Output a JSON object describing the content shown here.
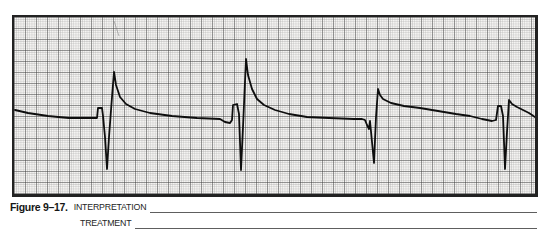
{
  "corner_mark": "’",
  "figure": {
    "label": "Figure 9–17.",
    "fields": [
      {
        "name": "INTERPRETATION"
      },
      {
        "name": "TREATMENT"
      }
    ]
  },
  "colors": {
    "paper": "#f5f4f2",
    "grid_minor": "#9f9f9f",
    "grid_major": "#3d3d3d",
    "trace": "#0e0e0e",
    "strip_border": "#222222",
    "blank_line": "#5e5e5e",
    "text": "#161616"
  },
  "chart_data": {
    "type": "line",
    "grid": {
      "minor_cell_px": 2.2,
      "major_cell_px": 11,
      "style": "standard ECG graph paper, minor and major squares"
    },
    "complex_count": 4,
    "complex_peak_x": [
      100,
      232,
      364,
      495
    ],
    "baseline_y": 102,
    "viewbox": [
      0,
      0,
      521,
      177
    ],
    "trace_points": [
      [
        1,
        93
      ],
      [
        14,
        96
      ],
      [
        34,
        99
      ],
      [
        55,
        101
      ],
      [
        80,
        101
      ],
      [
        83,
        101
      ],
      [
        84,
        91
      ],
      [
        88,
        91
      ],
      [
        89,
        99
      ],
      [
        91,
        120
      ],
      [
        93,
        152
      ],
      [
        95,
        120
      ],
      [
        98,
        80
      ],
      [
        100,
        55
      ],
      [
        102,
        68
      ],
      [
        106,
        80
      ],
      [
        112,
        87
      ],
      [
        121,
        92
      ],
      [
        136,
        96
      ],
      [
        158,
        99
      ],
      [
        183,
        101
      ],
      [
        206,
        102
      ],
      [
        211,
        105
      ],
      [
        216,
        106
      ],
      [
        218,
        103
      ],
      [
        219,
        88
      ],
      [
        223,
        87
      ],
      [
        225,
        97
      ],
      [
        226,
        125
      ],
      [
        227,
        153
      ],
      [
        229,
        110
      ],
      [
        232,
        42
      ],
      [
        234,
        58
      ],
      [
        238,
        72
      ],
      [
        243,
        82
      ],
      [
        250,
        88
      ],
      [
        261,
        93
      ],
      [
        275,
        97
      ],
      [
        293,
        100
      ],
      [
        315,
        101
      ],
      [
        340,
        102
      ],
      [
        348,
        102
      ],
      [
        351,
        103
      ],
      [
        353,
        108
      ],
      [
        355,
        112
      ],
      [
        356,
        104
      ],
      [
        358,
        125
      ],
      [
        360,
        146
      ],
      [
        362,
        100
      ],
      [
        364,
        72
      ],
      [
        366,
        78
      ],
      [
        369,
        82
      ],
      [
        377,
        86
      ],
      [
        390,
        89
      ],
      [
        406,
        91
      ],
      [
        424,
        94
      ],
      [
        442,
        97
      ],
      [
        456,
        99
      ],
      [
        468,
        102
      ],
      [
        478,
        104
      ],
      [
        482,
        103
      ],
      [
        484,
        89
      ],
      [
        487,
        89
      ],
      [
        489,
        99
      ],
      [
        490,
        125
      ],
      [
        491,
        152
      ],
      [
        493,
        115
      ],
      [
        495,
        83
      ],
      [
        498,
        87
      ],
      [
        503,
        90
      ],
      [
        509,
        93
      ],
      [
        515,
        96
      ],
      [
        521,
        100
      ]
    ],
    "artifact_mark": {
      "from": [
        100,
        4
      ],
      "to": [
        105,
        19
      ]
    }
  }
}
